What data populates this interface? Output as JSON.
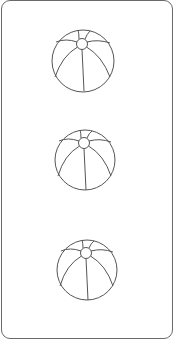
{
  "card": {
    "border_color": "#6a6a6a",
    "background": "#ffffff"
  },
  "items": [
    {
      "icon": "beach-ball-icon",
      "x": 50,
      "y": 28
    },
    {
      "icon": "beach-ball-icon",
      "x": 52,
      "y": 127
    },
    {
      "icon": "beach-ball-icon",
      "x": 54,
      "y": 237
    }
  ],
  "stroke_color": "#555555"
}
